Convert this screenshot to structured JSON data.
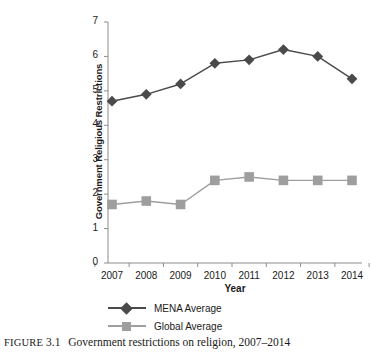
{
  "caption": {
    "prefix": "FIGURE",
    "number": "3.1",
    "text": "Government restrictions on religion, 2007–2014"
  },
  "colors": {
    "mena": "#4a4a4a",
    "global": "#9e9e9e",
    "axis": "#8c8c8c",
    "text": "#1a1a1a",
    "background": "#ffffff"
  },
  "legend": {
    "items": [
      {
        "label": "MENA Average",
        "marker": "diamond",
        "color": "#4a4a4a"
      },
      {
        "label": "Global Average",
        "marker": "square",
        "color": "#9e9e9e"
      }
    ]
  },
  "chart_data": {
    "type": "line",
    "title": "",
    "xlabel": "Year",
    "ylabel": "Government Religious Restrictions",
    "categories": [
      "2007",
      "2008",
      "2009",
      "2010",
      "2011",
      "2012",
      "2013",
      "2014"
    ],
    "x": [
      2007,
      2008,
      2009,
      2010,
      2011,
      2012,
      2013,
      2014
    ],
    "ylim": [
      0,
      7
    ],
    "yticks": [
      0,
      1,
      2,
      3,
      4,
      5,
      6,
      7
    ],
    "ytick_labels": [
      "0",
      "1",
      "2",
      "3",
      "4",
      "5",
      "6",
      "7"
    ],
    "grid": false,
    "legend_position": "bottom",
    "series": [
      {
        "name": "MENA Average",
        "marker": "diamond",
        "color": "#4a4a4a",
        "values": [
          4.7,
          4.9,
          5.2,
          5.8,
          5.9,
          6.2,
          6.0,
          5.35
        ]
      },
      {
        "name": "Global Average",
        "marker": "square",
        "color": "#9e9e9e",
        "values": [
          1.7,
          1.8,
          1.7,
          2.4,
          2.5,
          2.4,
          2.4,
          2.4
        ]
      }
    ]
  }
}
